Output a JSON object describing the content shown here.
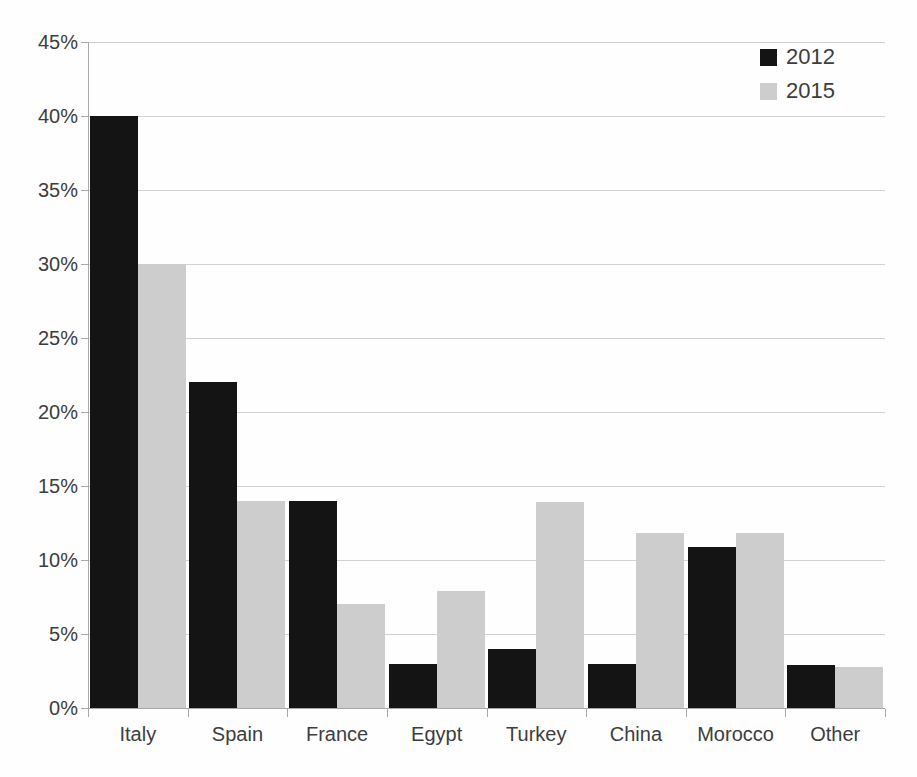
{
  "chart_data": {
    "type": "bar",
    "title": "",
    "subtitle": "",
    "xlabel": "",
    "ylabel": "",
    "categories": [
      "Italy",
      "Spain",
      "France",
      "Egypt",
      "Turkey",
      "China",
      "Morocco",
      "Other"
    ],
    "series": [
      {
        "name": "2012",
        "color": "#141414",
        "values": [
          40,
          22,
          14,
          3,
          4,
          3,
          10.9,
          2.9
        ]
      },
      {
        "name": "2015",
        "color": "#cdcdcd",
        "values": [
          30,
          14,
          7,
          7.9,
          13.9,
          11.8,
          11.8,
          2.8
        ]
      }
    ],
    "ylim": [
      0,
      45
    ],
    "y_ticks": [
      0,
      5,
      10,
      15,
      20,
      25,
      30,
      35,
      40,
      45
    ],
    "y_tick_labels": [
      "0%",
      "5%",
      "10%",
      "15%",
      "20%",
      "25%",
      "30%",
      "35%",
      "40%",
      "45%"
    ],
    "grid": true,
    "grid_axis": "y",
    "legend_position": "top-right",
    "legend_entries": [
      "2012",
      "2015"
    ],
    "value_format": "percent"
  },
  "colors": {
    "background": "#fefefe",
    "gridline": "#d2d2d2",
    "axis": "#a8a8a8",
    "text": "#3d3d3d",
    "series_2012": "#141414",
    "series_2015": "#cdcdcd"
  }
}
